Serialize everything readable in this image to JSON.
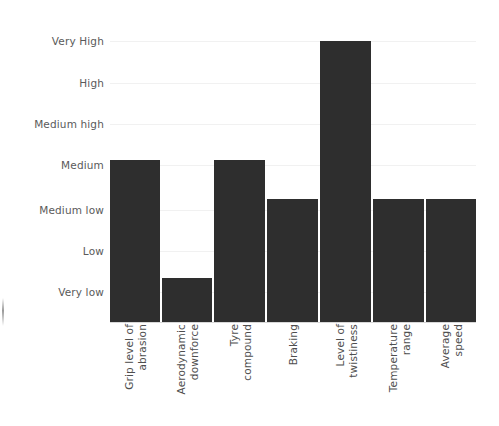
{
  "chart_data": {
    "type": "bar",
    "title": "",
    "subtitle": "",
    "xlabel": "",
    "ylabel": "",
    "grid": true,
    "legend": false,
    "legend_position": "none",
    "orientation": "vertical",
    "bar_color": "#2e2e2e",
    "gridline_color": "#f1f1f1",
    "axis_color": "#d8d8d8",
    "label_color": "#5a5a5a",
    "y_scale": "ordinal",
    "y_tick_labels": [
      "Very High",
      "High",
      "Medium high",
      "Medium",
      "Medium low",
      "Low",
      "Very low"
    ],
    "y_tick_values": [
      7,
      6,
      5,
      4,
      3,
      2,
      1
    ],
    "ylim": [
      0,
      7
    ],
    "categories": [
      "Grip level of abrasion",
      "Aerodynamic downforce",
      "Tyre compound",
      "Braking",
      "Level of twistiness",
      "Temperature range",
      "Average speed"
    ],
    "values": [
      4,
      1,
      4,
      3,
      7,
      3,
      3
    ],
    "value_labels": [
      "Medium",
      "Very low",
      "Medium",
      "Medium low",
      "Very High",
      "Medium low",
      "Medium low"
    ],
    "annotations": []
  }
}
